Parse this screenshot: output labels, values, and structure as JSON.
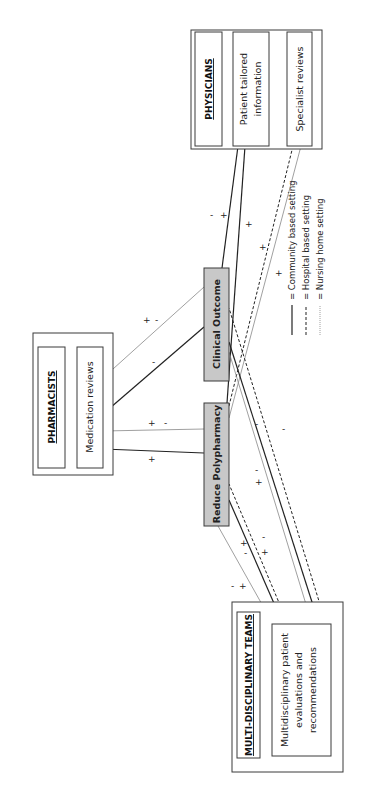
{
  "diagram": {
    "orientation": "rotated-90-ccw",
    "groups": {
      "physicians": {
        "title": "PHYSICIANS",
        "items": [
          {
            "lines": [
              "Patient tailored",
              "information"
            ]
          },
          {
            "lines": [
              "Specialist reviews"
            ]
          }
        ]
      },
      "pharmacists": {
        "title": "PHARMACISTS",
        "items": [
          {
            "lines": [
              "Medication reviews"
            ]
          }
        ]
      },
      "mdt": {
        "title": "MULTI-DISCIPLINARY TEAMS",
        "items": [
          {
            "lines": [
              "Multidisciplinary patient",
              "evaluations and",
              "recommendations"
            ]
          }
        ]
      }
    },
    "outcomes": {
      "clinical": "Clinical Outcome",
      "polypharmacy": "Reduce Polypharmacy"
    },
    "legend": [
      {
        "style": "solid",
        "label": "= Community based setting"
      },
      {
        "style": "dashed",
        "label": "= Hospital based setting"
      },
      {
        "style": "dotted",
        "label": "= Nursing home setting"
      }
    ],
    "connections": [
      {
        "from": "Patient tailored information",
        "to": "Clinical Outcome",
        "setting": "community",
        "signs": "- +"
      },
      {
        "from": "Patient tailored information",
        "to": "Reduce Polypharmacy",
        "setting": "community",
        "signs": "+"
      },
      {
        "from": "Specialist reviews",
        "to": "Reduce Polypharmacy",
        "setting": "hospital",
        "signs": "+"
      },
      {
        "from": "Specialist reviews",
        "to": "Reduce Polypharmacy",
        "setting": "nursing",
        "signs": "+"
      },
      {
        "from": "Medication reviews",
        "to": "Clinical Outcome",
        "setting": "nursing",
        "signs": "+ -"
      },
      {
        "from": "Medication reviews",
        "to": "Clinical Outcome",
        "setting": "community",
        "signs": "-"
      },
      {
        "from": "Medication reviews",
        "to": "Reduce Polypharmacy",
        "setting": "nursing",
        "signs": "+ -"
      },
      {
        "from": "Medication reviews",
        "to": "Reduce Polypharmacy",
        "setting": "community",
        "signs": "+"
      },
      {
        "from": "Multidisciplinary patient evaluations and recommendations",
        "to": "Reduce Polypharmacy",
        "setting": "community",
        "signs": "+ -"
      },
      {
        "from": "Multidisciplinary patient evaluations and recommendations",
        "to": "Reduce Polypharmacy",
        "setting": "hospital",
        "signs": "- +"
      },
      {
        "from": "Multidisciplinary patient evaluations and recommendations",
        "to": "Reduce Polypharmacy",
        "setting": "nursing",
        "signs": "- +"
      },
      {
        "from": "Multidisciplinary patient evaluations and recommendations",
        "to": "Clinical Outcome",
        "setting": "community",
        "signs": "- +"
      },
      {
        "from": "Multidisciplinary patient evaluations and recommendations",
        "to": "Clinical Outcome",
        "setting": "hospital",
        "signs": "-"
      },
      {
        "from": "Multidisciplinary patient evaluations and recommendations",
        "to": "Clinical Outcome",
        "setting": "nursing",
        "signs": "-"
      }
    ],
    "signs": {
      "plus": "+",
      "minus": "-"
    }
  }
}
